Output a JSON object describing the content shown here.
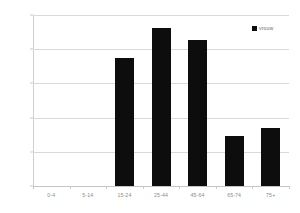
{
  "chart_data": {
    "type": "bar",
    "title": "",
    "xlabel": "",
    "ylabel": "",
    "categories": [
      "0-4",
      "5-14",
      "15-24",
      "25-44",
      "45-64",
      "65-74",
      "75+"
    ],
    "values": [
      0,
      0,
      1.87,
      2.31,
      2.14,
      0.73,
      0.85
    ],
    "series": [
      {
        "name": "vrouw",
        "color": "#0d0d0d",
        "values": [
          0,
          0,
          1.87,
          2.31,
          2.14,
          0.73,
          0.85
        ]
      }
    ],
    "ylim": [
      0,
      2.5
    ],
    "yticks": [
      0,
      0.5,
      1,
      1.5,
      2,
      2.5
    ],
    "ytick_labels": [
      "0",
      "0,5",
      "1",
      "1,5",
      "2",
      "2,5"
    ],
    "grid": true,
    "legend_position": "top-right",
    "legend_entries": [
      "vrouw"
    ],
    "colors": {
      "bar": "#0d0d0d",
      "gridline": "#d9d9d9",
      "axis": "#c9c9c9",
      "tick_text": "#8a8a8a",
      "legend_text": "#6f6f6f",
      "background": "#ffffff"
    }
  }
}
